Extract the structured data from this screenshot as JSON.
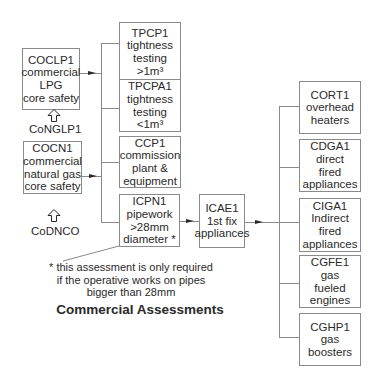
{
  "title": "Commercial Assessments",
  "left_column": {
    "coclp1": {
      "lines": [
        "COCLP1",
        "commercial",
        "LPG",
        "core safety"
      ]
    },
    "conglp1_label": "CoNGLP1",
    "cocn1": {
      "lines": [
        "COCN1",
        "commercial",
        "natural gas",
        "core safety"
      ]
    },
    "codnco_label": "CoDNCO"
  },
  "middle_column": {
    "tpcp1": {
      "lines": [
        "TPCP1",
        "tightness",
        "testing",
        ">1m³"
      ]
    },
    "tpcpa1": {
      "lines": [
        "TPCPA1",
        "tightness",
        "testing",
        "<1m³"
      ]
    },
    "ccp1": {
      "lines": [
        "CCP1",
        "commission",
        "plant &",
        "equipment"
      ]
    },
    "icpn1": {
      "lines": [
        "ICPN1",
        "pipework",
        ">28mm",
        "diameter *"
      ]
    }
  },
  "center": {
    "icae1": {
      "lines": [
        "ICAE1",
        "1st fix",
        "appliances"
      ]
    }
  },
  "right_column": {
    "cort1": {
      "lines": [
        "CORT1",
        "overhead",
        "heaters"
      ]
    },
    "cdga1": {
      "lines": [
        "CDGA1",
        "direct",
        "fired",
        "appliances"
      ]
    },
    "ciga1": {
      "lines": [
        "CIGA1",
        "Indirect",
        "fired",
        "appliances"
      ]
    },
    "cgfe1": {
      "lines": [
        "CGFE1",
        "gas",
        "fueled",
        "engines"
      ]
    },
    "cghp1": {
      "lines": [
        "CGHP1",
        "gas",
        "boosters"
      ]
    }
  },
  "footnote": {
    "lines": [
      "* this assessment is only required",
      "if the operative works on pipes",
      "bigger than 28mm"
    ]
  },
  "colors": {
    "line": "#8a8a8a",
    "text": "#2a2a2a",
    "background": "#ffffff"
  }
}
